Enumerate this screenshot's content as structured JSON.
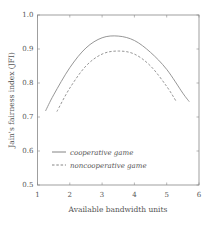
{
  "chart_data": {
    "type": "line",
    "title": "",
    "xlabel": "Available bandwidth units",
    "ylabel": "Jain's fairness index (JFI)",
    "xlim": [
      1,
      6
    ],
    "ylim": [
      0.5,
      1.0
    ],
    "xticks": [
      1,
      2,
      3,
      4,
      5,
      6
    ],
    "yticks": [
      0.5,
      0.6,
      0.7,
      0.8,
      0.9,
      1.0
    ],
    "ytick_labels": [
      "0.5",
      "0.6",
      "0.7",
      "0.8",
      "0.9",
      "1.0"
    ],
    "grid": false,
    "legend_position": "lower left (inside)",
    "series": [
      {
        "name": "cooperative game",
        "style": "solid",
        "x": [
          1.25,
          1.5,
          2.0,
          2.5,
          3.0,
          3.5,
          4.0,
          4.5,
          5.0,
          5.5,
          5.7
        ],
        "y": [
          0.718,
          0.765,
          0.845,
          0.903,
          0.933,
          0.938,
          0.925,
          0.89,
          0.84,
          0.77,
          0.745
        ]
      },
      {
        "name": "noncooperative game",
        "style": "dashed",
        "x": [
          1.6,
          2.0,
          2.5,
          3.0,
          3.5,
          4.0,
          4.5,
          5.0,
          5.3
        ],
        "y": [
          0.716,
          0.785,
          0.85,
          0.885,
          0.894,
          0.885,
          0.85,
          0.79,
          0.745
        ]
      }
    ]
  },
  "colors": {
    "axis": "#888888",
    "line": "#8a8a8a",
    "text": "#555555"
  }
}
